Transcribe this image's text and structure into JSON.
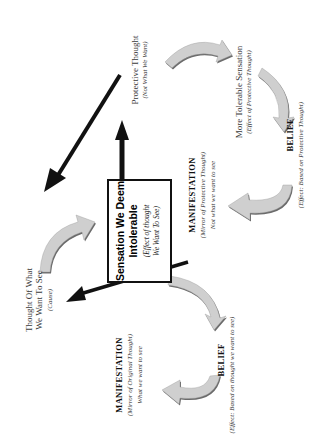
{
  "diagram": {
    "orientation": "rotated-90-ccw",
    "colors": {
      "background": "#ffffff",
      "arrow_fill": "#cfcfcf",
      "arrow_shadow": "#6a6a6a",
      "line": "#111111",
      "text": "#3a3a3a"
    },
    "center_box": {
      "title_line1": "Sensation We Deem",
      "title_line2": "Intolerable",
      "sub_line1": "(Effect of thought",
      "sub_line2": "We Want To See)"
    },
    "nodes": {
      "protective_thought": {
        "title": "Protective Thought",
        "sub": "(Not What We Want)"
      },
      "more_tolerable": {
        "title": "More Tolerable Sensation",
        "sub": "(Effect of Protective Thought)"
      },
      "belief_protective": {
        "title": "BELIEF",
        "sub": "(Effect: Based on Protective Thought)"
      },
      "manifestation_protective": {
        "title": "MANIFESTATION",
        "sub": "(Mirror of Protective Thought)",
        "note": "Not what we want to see"
      },
      "thought_want": {
        "title_line1": "Thought Of What",
        "title_line2": "We Want To See",
        "sub": "(Cause)"
      },
      "manifestation_original": {
        "title": "MANIFESTATION",
        "sub": "(Mirror of Original Thought)",
        "note": "What we want to see"
      },
      "belief_original": {
        "title": "BELIEF",
        "sub": "(Effect: Based on thought we want to see)"
      }
    }
  }
}
